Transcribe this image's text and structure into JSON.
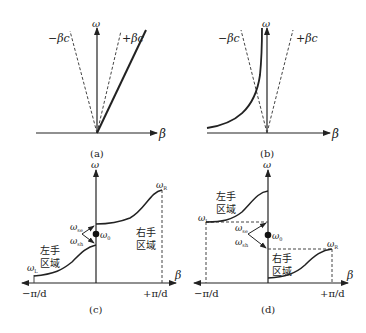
{
  "figure": {
    "panels": [
      {
        "id": "a",
        "caption": "(a)",
        "y_axis_label": "ω",
        "x_axis_label": "β",
        "light_lines": {
          "left": "−βc",
          "right": "+βc"
        },
        "description": "Right-handed medium: linear dispersion ω = βc"
      },
      {
        "id": "b",
        "caption": "(b)",
        "y_axis_label": "ω",
        "x_axis_label": "β",
        "light_lines": {
          "left": "−βc",
          "right": "+βc"
        },
        "description": "Left-handed medium: dispersion in negative β region"
      },
      {
        "id": "c",
        "caption": "(c)",
        "y_axis_label": "ω",
        "x_axis_label": "β",
        "x_ticks": {
          "left": "−π/d",
          "right": "+π/d"
        },
        "freq_labels": {
          "omega_L": {
            "base": "ω",
            "sub": "L"
          },
          "omega_R": {
            "base": "ω",
            "sub": "R"
          },
          "omega_se": {
            "base": "ω",
            "sub": "se"
          },
          "omega_sh": {
            "base": "ω",
            "sub": "sh"
          },
          "omega_0": {
            "base": "ω",
            "sub": "0"
          }
        },
        "regions": {
          "left_hand": [
            "左手",
            "区域"
          ],
          "right_hand": [
            "右手",
            "区域"
          ]
        }
      },
      {
        "id": "d",
        "caption": "(d)",
        "y_axis_label": "ω",
        "x_axis_label": "β",
        "x_ticks": {
          "left": "−π/d",
          "right": "+π/d"
        },
        "freq_labels": {
          "omega_L": {
            "base": "ω",
            "sub": "L"
          },
          "omega_R": {
            "base": "ω",
            "sub": "R"
          },
          "omega_se": {
            "base": "ω",
            "sub": "se"
          },
          "omega_sh": {
            "base": "ω",
            "sub": "sh"
          },
          "omega_0": {
            "base": "ω",
            "sub": "0"
          }
        },
        "regions": {
          "left_hand": [
            "左手",
            "区域"
          ],
          "right_hand": [
            "右手",
            "区域"
          ]
        }
      }
    ],
    "colors": {
      "line": "#222222",
      "dashed": "#444444",
      "background": "#ffffff"
    }
  }
}
